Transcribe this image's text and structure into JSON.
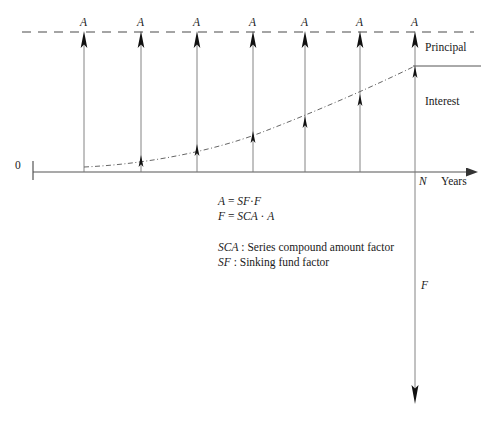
{
  "figure": {
    "type": "cash-flow-diagram",
    "title_visible": false,
    "axis": {
      "x_label": "Years",
      "origin_label": "0",
      "end_label": "N",
      "baseline_y": 172,
      "start_x": 33,
      "end_x": 472
    },
    "series_label": "A",
    "payment_count": 7,
    "payment_labels": [
      "A",
      "A",
      "A",
      "A",
      "A",
      "A",
      "A"
    ],
    "payment_x": [
      84,
      141,
      197,
      253,
      305,
      360,
      415
    ],
    "dashed_line_y": 32,
    "future_value": {
      "label": "F",
      "direction": "down",
      "tip_y": 404
    },
    "brackets": {
      "principal_label": "Principal",
      "interest_label": "Interest",
      "divider_y": 66
    },
    "curve": {
      "description": "accumulated-balance-curve",
      "style": "dash-dot",
      "start": [
        84,
        167
      ],
      "end": [
        415,
        66
      ]
    }
  },
  "equations": [
    {
      "lhs": "A",
      "rhs_factor": "SF",
      "rhs_var": "F",
      "text": "A = SF · F"
    },
    {
      "lhs": "F",
      "rhs_factor": "SCA",
      "rhs_var": "A",
      "text": "F = SCA · A"
    }
  ],
  "legend": [
    {
      "symbol": "SCA",
      "separator": " : ",
      "definition": "Series compound amount factor"
    },
    {
      "symbol": "SF",
      "separator": " : ",
      "definition": "Sinking fund factor"
    }
  ],
  "colors": {
    "background": "#ffffff",
    "axis": "#555555",
    "stem": "#777777",
    "arrowhead": "#111111",
    "dashed": "#4a4a4a",
    "curve": "#666666",
    "text": "#1a1a1a"
  }
}
